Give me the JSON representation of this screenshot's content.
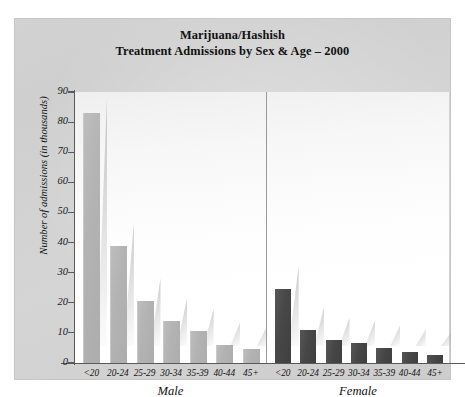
{
  "chart_data": {
    "type": "bar",
    "title": "Marijuana/Hashish\nTreatment Admissions by Sex & Age – 2000",
    "title_line1": "Marijuana/Hashish",
    "title_line2": "Treatment Admissions by Sex & Age – 2000",
    "xlabel": "",
    "ylabel": "Number of admissions (in thousands)",
    "ylim": [
      0,
      90
    ],
    "yticks": [
      0,
      10,
      20,
      30,
      40,
      50,
      60,
      70,
      80,
      90
    ],
    "grid": false,
    "legend": "none",
    "categories": [
      "<20",
      "20-24",
      "25-29",
      "30-34",
      "35-39",
      "40-44",
      "45+"
    ],
    "groups": [
      "Male",
      "Female"
    ],
    "series": [
      {
        "name": "Male",
        "color": "#b3b3b3",
        "values": [
          83,
          39,
          20.5,
          14,
          10.5,
          6,
          4.5
        ]
      },
      {
        "name": "Female",
        "color": "#474747",
        "values": [
          24.5,
          11,
          7.5,
          6.5,
          5,
          3.5,
          2.5
        ]
      }
    ]
  },
  "figure": {
    "background_color": "#d2d2d2",
    "plot_background_color": "#ffffff",
    "axis_color": "#5a5a5a",
    "divider_color": "#9a9a9a"
  }
}
